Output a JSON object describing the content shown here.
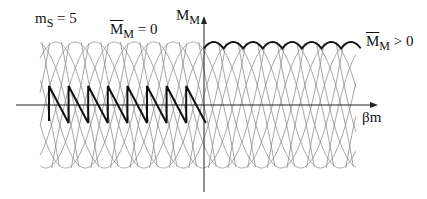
{
  "labels": {
    "ms": {
      "main": "m",
      "sub": "S",
      "rest": " = 5"
    },
    "mbar_zero": {
      "main": "M",
      "sub": "M",
      "rest": " = 0"
    },
    "y_axis": {
      "main": "M",
      "sub": "M"
    },
    "mbar_pos": {
      "main": "M",
      "sub": "M",
      "rest": " > 0"
    },
    "x_axis": {
      "main": "βm"
    }
  },
  "colors": {
    "grid": "#8c8c8c",
    "axis": "#222222",
    "highlight": "#111111",
    "background": "#ffffff"
  },
  "geometry": {
    "x_axis_y": 105,
    "y_axis_x": 204,
    "grid_left": 40,
    "grid_right": 356,
    "grid_top": 42,
    "grid_bottom": 168,
    "period": 19.6,
    "sawtooth_teeth": 8,
    "sawtooth_start_x": 49,
    "sawtooth_peak_y": 86,
    "sawtooth_trough_y": 123
  }
}
